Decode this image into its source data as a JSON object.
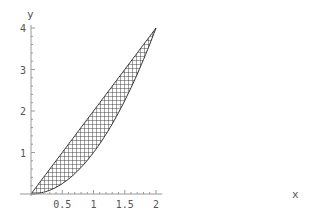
{
  "chart_data": {
    "type": "area",
    "title": "",
    "xlabel": "x",
    "ylabel": "y",
    "xlim": [
      0,
      2.1
    ],
    "ylim": [
      0,
      4
    ],
    "x_ticks": [
      0.5,
      1,
      1.5,
      2
    ],
    "x_tick_labels": [
      "0.5",
      "1",
      "1.5",
      "2"
    ],
    "y_ticks": [
      1,
      2,
      3,
      4
    ],
    "y_tick_labels": [
      "1",
      "2",
      "3",
      "4"
    ],
    "grid": false,
    "fill_pattern": "crosshatch",
    "series": [
      {
        "name": "upper boundary y = 2x",
        "x": [
          0,
          0.5,
          1,
          1.5,
          2
        ],
        "values": [
          0,
          1,
          2,
          3,
          4
        ]
      },
      {
        "name": "lower boundary y = x^2",
        "x": [
          0,
          0.5,
          1,
          1.5,
          2
        ],
        "values": [
          0,
          0.25,
          1,
          2.25,
          4
        ]
      }
    ],
    "colors": {
      "hatch": "#333333",
      "axis": "#999999",
      "text": "#555555"
    }
  }
}
